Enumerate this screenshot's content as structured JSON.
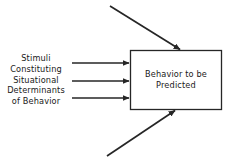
{
  "diagram": {
    "type": "block-flow-diagram",
    "background_color": "#ffffff",
    "stroke_color": "#262626",
    "text_color": "#1a1a1a",
    "inputs_label": {
      "lines": [
        "Stimuli",
        "Constituting",
        "Situational",
        "Determinants",
        "of Behavior"
      ]
    },
    "box": {
      "lines": [
        "Behavior to be",
        "Predicted"
      ],
      "x": 130,
      "y": 50,
      "width": 92,
      "height": 60
    },
    "arrows": [
      {
        "name": "horizontal-arrow-1",
        "x1": 72,
        "y1": 63,
        "x2": 130,
        "y2": 63
      },
      {
        "name": "horizontal-arrow-2",
        "x1": 72,
        "y1": 81,
        "x2": 130,
        "y2": 81
      },
      {
        "name": "horizontal-arrow-3",
        "x1": 72,
        "y1": 98,
        "x2": 130,
        "y2": 98
      },
      {
        "name": "diagonal-arrow-top",
        "x1": 110,
        "y1": 6,
        "x2": 181,
        "y2": 50
      },
      {
        "name": "diagonal-arrow-bottom",
        "x1": 107,
        "y1": 156,
        "x2": 176,
        "y2": 110
      }
    ]
  }
}
